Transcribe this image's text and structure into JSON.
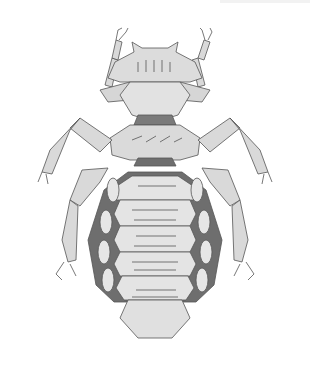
{
  "image": {
    "subject": "louse-illustration",
    "width": 310,
    "height": 365,
    "colors": {
      "background": "#ffffff",
      "body_fill": "#d9d9d9",
      "body_light": "#e8e8e8",
      "outline": "#555555",
      "dark_band": "#6e6e6e",
      "hair": "#444444"
    }
  }
}
